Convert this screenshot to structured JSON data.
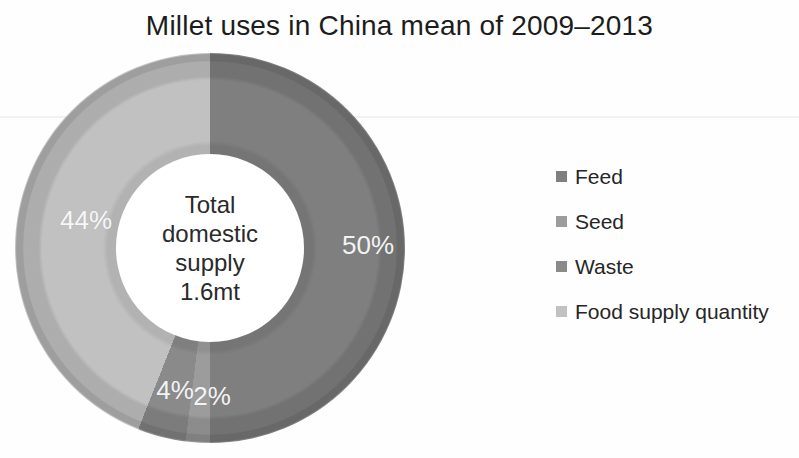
{
  "chart_data": {
    "type": "pie",
    "donut": true,
    "hole_ratio": 0.48,
    "title": "Millet uses in China mean of 2009–2013",
    "categories": [
      "Feed",
      "Seed",
      "Waste",
      "Food supply quantity"
    ],
    "values": [
      50,
      2,
      4,
      44
    ],
    "unit": "%",
    "slice_labels": [
      "50%",
      "2%",
      "4%",
      "44%"
    ],
    "colors": [
      "#7f7f7f",
      "#9c9c9c",
      "#8a8a8a",
      "#c1c1c1"
    ],
    "center_label": [
      "Total",
      "domestic",
      "supply",
      "1.6mt"
    ],
    "start_angle_deg": 0,
    "direction": "clockwise",
    "legend_position": "right",
    "label_color": "#f3f3f3",
    "title_color": "#1c1c1c"
  }
}
